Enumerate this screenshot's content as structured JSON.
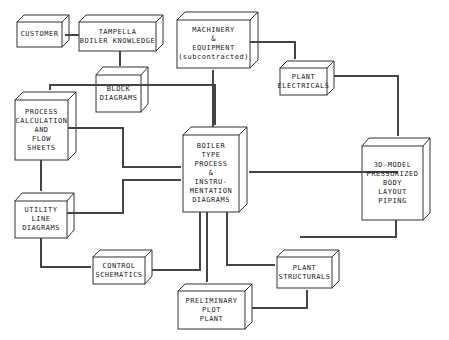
{
  "diagram": {
    "type": "block-flow",
    "nodes": [
      {
        "id": "customer",
        "lines": [
          "CUSTOMER"
        ]
      },
      {
        "id": "tampella",
        "lines": [
          "TAMPELLA",
          "BOILER KNOWLEDGE"
        ]
      },
      {
        "id": "machinery",
        "lines": [
          "MACHINERY",
          "&",
          "EQUIPMENT",
          "(subcontracted)"
        ]
      },
      {
        "id": "electricals",
        "lines": [
          "PLANT",
          "ELECTRICALS"
        ]
      },
      {
        "id": "block",
        "lines": [
          "BLOCK",
          "DIAGRAMS"
        ]
      },
      {
        "id": "process",
        "lines": [
          "PROCESS",
          "CALCULATION",
          "AND",
          "FLOW",
          "SHEETS"
        ]
      },
      {
        "id": "boiler",
        "lines": [
          "BOILER",
          "TYPE",
          "PROCESS",
          "&",
          "INSTRU-",
          "MENTATION",
          "DIAGRAMS"
        ]
      },
      {
        "id": "model",
        "lines": [
          "3D-MODEL",
          "PRESSURIZED",
          "BODY",
          "LAYOUT",
          "PIPING"
        ]
      },
      {
        "id": "utility",
        "lines": [
          "UTILITY",
          "LINE",
          "DIAGRAMS"
        ]
      },
      {
        "id": "control",
        "lines": [
          "CONTROL",
          "SCHEMATICS"
        ]
      },
      {
        "id": "structurals",
        "lines": [
          "PLANT",
          "STRUCTURALS"
        ]
      },
      {
        "id": "plot",
        "lines": [
          "PRELIMINARY",
          "PLOT",
          "PLANT"
        ]
      }
    ],
    "edges": [
      {
        "from": "tampella",
        "to": "customer"
      },
      {
        "from": "tampella",
        "to": "block"
      },
      {
        "from": "block",
        "to": "process"
      },
      {
        "from": "block",
        "to": "boiler"
      },
      {
        "from": "process",
        "to": "utility"
      },
      {
        "from": "process",
        "to": "boiler"
      },
      {
        "from": "utility",
        "to": "boiler"
      },
      {
        "from": "utility",
        "to": "control"
      },
      {
        "from": "boiler",
        "to": "machinery"
      },
      {
        "from": "machinery",
        "to": "electricals"
      },
      {
        "from": "electricals",
        "to": "model"
      },
      {
        "from": "model",
        "to": "boiler"
      },
      {
        "from": "boiler",
        "to": "control"
      },
      {
        "from": "boiler",
        "to": "plot"
      },
      {
        "from": "boiler",
        "to": "structurals"
      },
      {
        "from": "model",
        "to": "structurals"
      },
      {
        "from": "plot",
        "to": "structurals"
      }
    ]
  }
}
